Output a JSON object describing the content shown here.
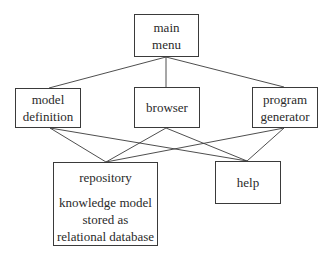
{
  "diagram": {
    "type": "hierarchy",
    "nodes": {
      "main_menu": {
        "lines": [
          "main",
          "menu"
        ]
      },
      "model_definition": {
        "lines": [
          "model",
          "definition"
        ]
      },
      "browser": {
        "lines": [
          "browser"
        ]
      },
      "program_generator": {
        "lines": [
          "program",
          "generator"
        ]
      },
      "repository": {
        "title": "repository",
        "lines": [
          "knowledge model",
          "stored as",
          "relational database"
        ]
      },
      "help": {
        "lines": [
          "help"
        ]
      }
    },
    "edges": [
      {
        "from": "main_menu",
        "to": "model_definition"
      },
      {
        "from": "main_menu",
        "to": "browser"
      },
      {
        "from": "main_menu",
        "to": "program_generator"
      },
      {
        "from": "model_definition",
        "to": "repository"
      },
      {
        "from": "model_definition",
        "to": "help"
      },
      {
        "from": "browser",
        "to": "repository"
      },
      {
        "from": "browser",
        "to": "help"
      },
      {
        "from": "program_generator",
        "to": "repository"
      },
      {
        "from": "program_generator",
        "to": "help"
      }
    ],
    "colors": {
      "stroke": "#3a3a3a",
      "text": "#2a2a2a",
      "background": "#ffffff"
    }
  }
}
